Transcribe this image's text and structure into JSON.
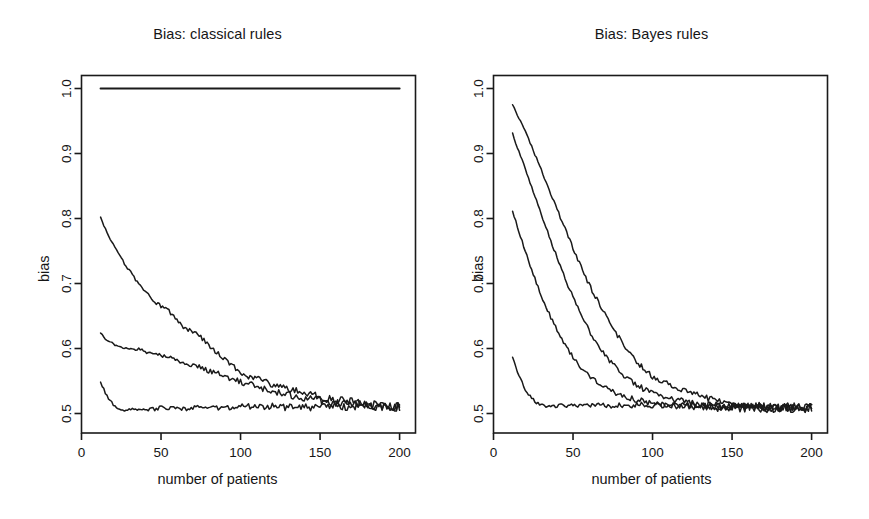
{
  "figure": {
    "background": "#ffffff",
    "ink": "#1a1a1a",
    "panel_count": 2
  },
  "panels": [
    {
      "id": "classical",
      "title": "Bias: classical rules",
      "xlabel": "number of patients",
      "ylabel": "bias",
      "xticks": [
        "0",
        "50",
        "100",
        "150",
        "200"
      ],
      "yticks": [
        "0.5",
        "0.6",
        "0.7",
        "0.8",
        "0.9",
        "1.0"
      ]
    },
    {
      "id": "bayes",
      "title": "Bias: Bayes rules",
      "xlabel": "number of patients",
      "ylabel": "bias",
      "xticks": [
        "0",
        "50",
        "100",
        "150",
        "200"
      ],
      "yticks": [
        "0.5",
        "0.6",
        "0.7",
        "0.8",
        "0.9",
        "1.0"
      ]
    }
  ],
  "chart_data": [
    {
      "type": "line",
      "title": "Bias: classical rules",
      "xlabel": "number of patients",
      "ylabel": "bias",
      "xlim": [
        0,
        210
      ],
      "ylim": [
        0.47,
        1.02
      ],
      "xticks": [
        0,
        50,
        100,
        150,
        200
      ],
      "yticks": [
        0.5,
        0.6,
        0.7,
        0.8,
        0.9,
        1.0
      ],
      "grid": false,
      "legend": "none",
      "x": [
        12,
        16,
        20,
        24,
        28,
        32,
        36,
        40,
        44,
        48,
        52,
        56,
        60,
        64,
        68,
        72,
        76,
        80,
        84,
        88,
        92,
        96,
        100,
        104,
        108,
        112,
        116,
        120,
        124,
        128,
        132,
        136,
        140,
        144,
        148,
        152,
        156,
        160,
        164,
        168,
        172,
        176,
        180,
        184,
        188,
        192,
        196,
        200
      ],
      "series": [
        {
          "name": "flat-at-one",
          "values": [
            1.0,
            1.0,
            1.0,
            1.0,
            1.0,
            1.0,
            1.0,
            1.0,
            1.0,
            1.0,
            1.0,
            1.0,
            1.0,
            1.0,
            1.0,
            1.0,
            1.0,
            1.0,
            1.0,
            1.0,
            1.0,
            1.0,
            1.0,
            1.0,
            1.0,
            1.0,
            1.0,
            1.0,
            1.0,
            1.0,
            1.0,
            1.0,
            1.0,
            1.0,
            1.0,
            1.0,
            1.0,
            1.0,
            1.0,
            1.0,
            1.0,
            1.0,
            1.0,
            1.0,
            1.0,
            1.0,
            1.0,
            1.0
          ]
        },
        {
          "name": "upper-decay",
          "values": [
            0.801,
            0.777,
            0.759,
            0.742,
            0.727,
            0.713,
            0.7,
            0.688,
            0.677,
            0.668,
            0.663,
            0.655,
            0.643,
            0.634,
            0.628,
            0.624,
            0.615,
            0.606,
            0.596,
            0.588,
            0.581,
            0.572,
            0.564,
            0.558,
            0.556,
            0.554,
            0.549,
            0.544,
            0.541,
            0.539,
            0.537,
            0.534,
            0.531,
            0.529,
            0.527,
            0.525,
            0.522,
            0.521,
            0.519,
            0.518,
            0.517,
            0.515,
            0.514,
            0.513,
            0.512,
            0.512,
            0.511,
            0.511
          ]
        },
        {
          "name": "middle-decay",
          "values": [
            0.625,
            0.613,
            0.607,
            0.602,
            0.601,
            0.598,
            0.599,
            0.596,
            0.592,
            0.59,
            0.588,
            0.585,
            0.582,
            0.579,
            0.576,
            0.573,
            0.57,
            0.566,
            0.563,
            0.559,
            0.556,
            0.552,
            0.549,
            0.546,
            0.543,
            0.54,
            0.537,
            0.534,
            0.532,
            0.53,
            0.528,
            0.526,
            0.524,
            0.522,
            0.521,
            0.52,
            0.518,
            0.517,
            0.516,
            0.515,
            0.514,
            0.513,
            0.512,
            0.512,
            0.511,
            0.511,
            0.51,
            0.51
          ]
        },
        {
          "name": "lower-flat",
          "values": [
            0.548,
            0.527,
            0.513,
            0.506,
            0.504,
            0.506,
            0.508,
            0.507,
            0.506,
            0.508,
            0.51,
            0.508,
            0.509,
            0.507,
            0.508,
            0.509,
            0.51,
            0.509,
            0.508,
            0.509,
            0.51,
            0.509,
            0.51,
            0.511,
            0.51,
            0.509,
            0.51,
            0.511,
            0.51,
            0.509,
            0.51,
            0.51,
            0.509,
            0.51,
            0.51,
            0.509,
            0.51,
            0.51,
            0.509,
            0.51,
            0.51,
            0.511,
            0.51,
            0.51,
            0.511,
            0.51,
            0.51,
            0.51
          ]
        }
      ]
    },
    {
      "type": "line",
      "title": "Bias: Bayes rules",
      "xlabel": "number of patients",
      "ylabel": "bias",
      "xlim": [
        0,
        210
      ],
      "ylim": [
        0.47,
        1.02
      ],
      "xticks": [
        0,
        50,
        100,
        150,
        200
      ],
      "yticks": [
        0.5,
        0.6,
        0.7,
        0.8,
        0.9,
        1.0
      ],
      "grid": false,
      "legend": "none",
      "x": [
        12,
        16,
        20,
        24,
        28,
        32,
        36,
        40,
        44,
        48,
        52,
        56,
        60,
        64,
        68,
        72,
        76,
        80,
        84,
        88,
        92,
        96,
        100,
        104,
        108,
        112,
        116,
        120,
        124,
        128,
        132,
        136,
        140,
        144,
        148,
        152,
        156,
        160,
        164,
        168,
        172,
        176,
        180,
        184,
        188,
        192,
        196,
        200
      ],
      "series": [
        {
          "name": "curve-1-highest",
          "values": [
            0.975,
            0.955,
            0.933,
            0.91,
            0.887,
            0.862,
            0.838,
            0.814,
            0.79,
            0.766,
            0.742,
            0.72,
            0.699,
            0.68,
            0.663,
            0.645,
            0.629,
            0.612,
            0.598,
            0.585,
            0.574,
            0.566,
            0.557,
            0.551,
            0.547,
            0.543,
            0.54,
            0.534,
            0.531,
            0.528,
            0.525,
            0.522,
            0.52,
            0.518,
            0.517,
            0.515,
            0.514,
            0.513,
            0.512,
            0.512,
            0.511,
            0.511,
            0.51,
            0.51,
            0.51,
            0.509,
            0.509,
            0.509
          ]
        },
        {
          "name": "curve-2",
          "values": [
            0.93,
            0.903,
            0.876,
            0.848,
            0.82,
            0.793,
            0.766,
            0.74,
            0.714,
            0.69,
            0.668,
            0.647,
            0.628,
            0.612,
            0.597,
            0.584,
            0.573,
            0.563,
            0.554,
            0.547,
            0.541,
            0.536,
            0.532,
            0.528,
            0.525,
            0.522,
            0.52,
            0.518,
            0.516,
            0.515,
            0.514,
            0.513,
            0.512,
            0.511,
            0.511,
            0.51,
            0.51,
            0.51,
            0.509,
            0.509,
            0.509,
            0.509,
            0.508,
            0.508,
            0.508,
            0.508,
            0.508,
            0.508
          ]
        },
        {
          "name": "curve-3",
          "values": [
            0.812,
            0.78,
            0.75,
            0.721,
            0.695,
            0.67,
            0.648,
            0.628,
            0.61,
            0.594,
            0.58,
            0.568,
            0.558,
            0.55,
            0.543,
            0.537,
            0.532,
            0.528,
            0.525,
            0.522,
            0.52,
            0.518,
            0.516,
            0.515,
            0.514,
            0.513,
            0.512,
            0.511,
            0.511,
            0.51,
            0.51,
            0.51,
            0.509,
            0.509,
            0.509,
            0.509,
            0.508,
            0.508,
            0.508,
            0.508,
            0.508,
            0.508,
            0.508,
            0.508,
            0.508,
            0.507,
            0.507,
            0.507
          ]
        },
        {
          "name": "curve-4-lowest",
          "values": [
            0.586,
            0.558,
            0.537,
            0.523,
            0.515,
            0.512,
            0.511,
            0.512,
            0.513,
            0.512,
            0.512,
            0.513,
            0.512,
            0.512,
            0.513,
            0.512,
            0.512,
            0.513,
            0.513,
            0.512,
            0.513,
            0.513,
            0.512,
            0.513,
            0.513,
            0.512,
            0.512,
            0.513,
            0.512,
            0.512,
            0.512,
            0.512,
            0.511,
            0.512,
            0.511,
            0.511,
            0.511,
            0.511,
            0.51,
            0.511,
            0.51,
            0.51,
            0.51,
            0.51,
            0.509,
            0.509,
            0.509,
            0.509
          ]
        }
      ]
    }
  ]
}
